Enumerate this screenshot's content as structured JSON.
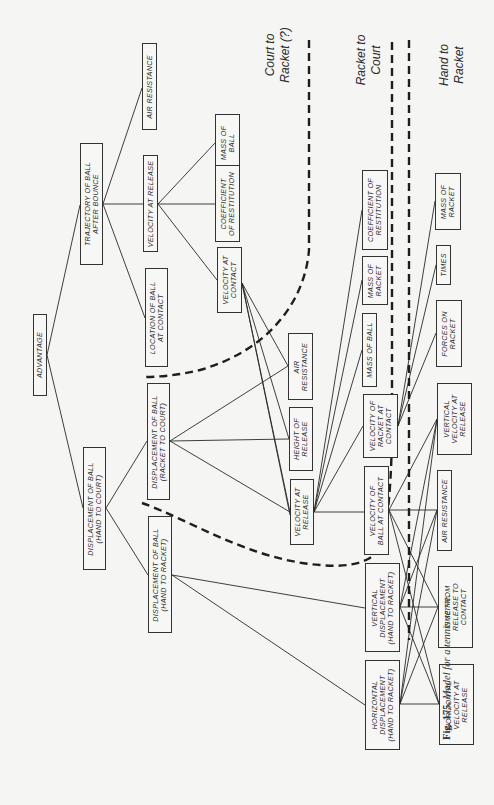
{
  "diagram": {
    "orientation": "rotated 90 degrees counter-clockwise",
    "regions": {
      "court_to_racket": "Court to\nRacket (?)",
      "racket_to_court": "Racket to\nCourt",
      "hand_to_racket": "Hand to\nRacket"
    },
    "nodes": {
      "advantage": "ADVANTAGE",
      "trajectory_after_bounce": "TRAJECTORY OF BALL\nAFTER BOUNCE",
      "air_resistance_1": "AIR RESISTANCE",
      "velocity_at_release_1": "VELOCITY AT RELEASE",
      "mass_of_ball_1": "MASS OF\nBALL",
      "coefficient_restitution_1": "COEFFICIENT\nOF RESTITUTION",
      "velocity_at_contact_1": "VELOCITY AT\nCONTACT",
      "location_of_ball_at_contact": "LOCATION OF BALL\nAT CONTACT",
      "displacement_hand_to_court": "DISPLACEMENT OF BALL\n(HAND TO COURT)",
      "displacement_racket_to_court": "DISPLACEMENT OF BALL\n(RACKET TO COURT)",
      "displacement_hand_to_racket": "DISPLACEMENT OF BALL\n(HAND TO RACKET)",
      "air_resistance_2": "AIR\nRESISTANCE",
      "height_of_release": "HEIGHT OF\nRELEASE",
      "velocity_at_release_2": "VELOCITY AT\nRELEASE",
      "mass_of_ball_2": "MASS OF BALL",
      "mass_of_racket_1": "MASS OF\nRACKET",
      "coefficient_restitution_2": "COEFFICIENT OF\nRESTITUTION",
      "velocity_of_racket_at_contact": "VELOCITY OF\nRACKET AT\nCONTACT",
      "velocity_of_ball_at_contact": "VELOCITY OF\nBALL AT CONTACT",
      "forces_on_racket": "FORCES ON\nRACKET",
      "times": "TIMES",
      "mass_of_racket_2": "MASS OF\nRACKET",
      "vertical_velocity_at_release": "VERTICAL\nVELOCITY AT\nRELEASE",
      "air_resistance_3": "AIR RESISTANCE",
      "vertical_displacement": "VERTICAL\nDISPLACEMENT\n(HAND TO RACKET)",
      "time_from_release_to_contact": "TIME FROM\nRELEASE TO\nCONTACT",
      "horizontal_displacement": "HORIZONTAL\nDISPLACEMENT\n(HAND TO RACKET)",
      "horizontal_velocity_at_release": "HORIZONTAL\nVELOCITY AT\nRELEASE"
    },
    "caption": {
      "label": "Fig. 175.",
      "text": "Model for a tennis serve."
    }
  }
}
